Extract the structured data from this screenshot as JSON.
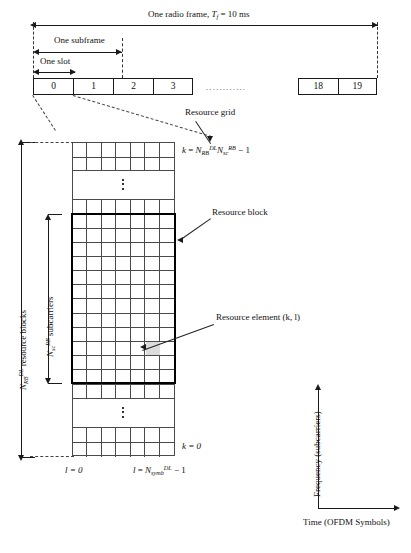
{
  "figure": {
    "frame": {
      "caption_prefix": "One radio frame, ",
      "caption_symbol": "T",
      "caption_symbol_sub": "f",
      "caption_value": " = 10 ms",
      "subframe_label": "One subframe",
      "slot_label": "One slot",
      "slots_visible": [
        "0",
        "1",
        "2",
        "3",
        "18",
        "19"
      ],
      "slots_head": [
        "0",
        "1",
        "2",
        "3"
      ],
      "slots_tail": [
        "18",
        "19"
      ],
      "ellipsis": "............"
    },
    "grid": {
      "resource_grid_label": "Resource grid",
      "resource_block_label": "Resource block",
      "resource_element_label": "Resource element (k, l)",
      "k_max": {
        "lhs": "k",
        "eq": " = ",
        "term1": "N",
        "term1_sub": "RB",
        "term1_sup": "DL",
        "term2": "N",
        "term2_sub": "sc",
        "term2_sup": "RB",
        "tail": " − 1"
      },
      "k_min": "k = 0",
      "l_min": "l = 0",
      "l_max": {
        "lhs": "l",
        "eq": " = ",
        "term": "N",
        "term_sub": "symb",
        "term_sup": "DL",
        "tail": " − 1"
      },
      "resource_blocks_axis": {
        "symbol": "N",
        "sub": "RB",
        "sup": "DL",
        "text": " resource blocks"
      },
      "subcarriers_axis": {
        "symbol": "N",
        "sub": "sc",
        "sup": "RB",
        "text": " subcarriers"
      },
      "columns": 7,
      "rb_rows": 12,
      "top_rows": 2,
      "upper_rows": 1,
      "lower_rows": 1,
      "bottom_rows": 2
    },
    "axes": {
      "y_label": "Frequency (subcarriers)",
      "x_label": "Time (OFDM Symbols)"
    },
    "colors": {
      "line": "#1a1a1a",
      "grid_line": "#4a4a4a",
      "resource_element_fill": "#dcdcdc",
      "background": "#ffffff"
    }
  }
}
